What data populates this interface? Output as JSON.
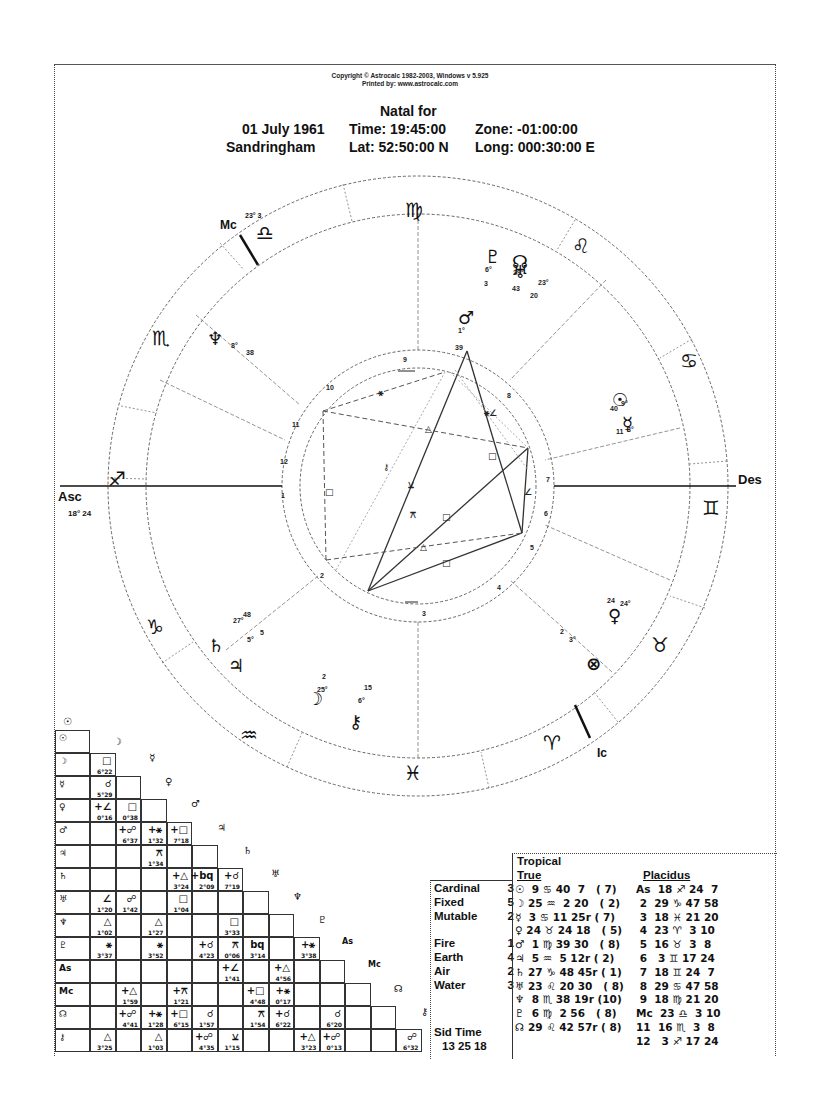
{
  "header": {
    "copyright": "Copyright © Astrocalc 1982-2003, Windows v 5.925",
    "printed_by": "Printed by: www.astrocalc.com",
    "title": "Natal for",
    "date": "01 July 1961",
    "time": "Time: 19:45:00",
    "zone": "Zone: -01:00:00",
    "place": "Sandringham",
    "lat": "Lat: 52:50:00 N",
    "long": "Long: 000:30:00 E"
  },
  "wheel": {
    "angles": {
      "asc_label": "Asc",
      "asc_degree": "18° 24",
      "des_label": "Des",
      "mc_label": "Mc",
      "mc_degree": "23° 3",
      "ic_label": "Ic"
    },
    "signs": [
      {
        "name": "virgo",
        "glyph": "♍"
      },
      {
        "name": "leo",
        "glyph": "♌"
      },
      {
        "name": "cancer",
        "glyph": "♋"
      },
      {
        "name": "gemini",
        "glyph": "♊"
      },
      {
        "name": "taurus",
        "glyph": "♉"
      },
      {
        "name": "aries",
        "glyph": "♈"
      },
      {
        "name": "pisces",
        "glyph": "♓"
      },
      {
        "name": "aquarius",
        "glyph": "♒"
      },
      {
        "name": "capricorn",
        "glyph": "♑"
      },
      {
        "name": "sagittarius",
        "glyph": "♐"
      },
      {
        "name": "scorpio",
        "glyph": "♏"
      },
      {
        "name": "libra",
        "glyph": "♎"
      }
    ],
    "planets": [
      {
        "name": "pluto",
        "glyph": "♇",
        "deg": "6°",
        "min": "3"
      },
      {
        "name": "north-node",
        "glyph": "☊",
        "deg": "29°",
        "min": "43"
      },
      {
        "name": "uranus",
        "glyph": "♅",
        "deg": "23°",
        "min": "20"
      },
      {
        "name": "mars",
        "glyph": "♂",
        "deg": "1°",
        "min": "39"
      },
      {
        "name": "neptune",
        "glyph": "♆",
        "deg": "8°",
        "min": "38"
      },
      {
        "name": "sun",
        "glyph": "☉",
        "deg": "9°",
        "min": "40"
      },
      {
        "name": "mercury",
        "glyph": "☿",
        "deg": "3°",
        "min": "11"
      },
      {
        "name": "venus",
        "glyph": "♀",
        "deg": "24°",
        "min": "24"
      },
      {
        "name": "part-of-fortune",
        "glyph": "⊗",
        "deg": "3°",
        "min": "2"
      },
      {
        "name": "saturn",
        "glyph": "♄",
        "deg": "27°",
        "min": "48"
      },
      {
        "name": "jupiter",
        "glyph": "♃",
        "deg": "5°",
        "min": "5"
      },
      {
        "name": "moon",
        "glyph": "☽",
        "deg": "25°",
        "min": "2"
      },
      {
        "name": "chiron",
        "glyph": "⚷",
        "deg": "6°",
        "min": "15"
      }
    ],
    "houses": [
      "1",
      "2",
      "3",
      "4",
      "5",
      "6",
      "7",
      "8",
      "9",
      "10",
      "11",
      "12"
    ]
  },
  "aspect_grid": {
    "headers": [
      "☉",
      "☽",
      "♅",
      "♀",
      "♂",
      "♃",
      "♄",
      "♅",
      "♆",
      "♇",
      "As",
      "Mc",
      "☊",
      "⚷"
    ],
    "rows": [
      {
        "label": "☉",
        "cells": []
      },
      {
        "label": "☽",
        "cells": [
          {
            "col": 0,
            "asp": "□",
            "orb": "6°22"
          }
        ]
      },
      {
        "label": "☿",
        "cells": [
          {
            "col": 0,
            "asp": "☌",
            "orb": "5°29"
          }
        ]
      },
      {
        "label": "♀",
        "cells": [
          {
            "col": 0,
            "asp": "+∠",
            "orb": "0°16"
          },
          {
            "col": 1,
            "asp": "□",
            "orb": "0°38"
          }
        ]
      },
      {
        "label": "♂",
        "cells": [
          {
            "col": 1,
            "asp": "+☍",
            "orb": "6°37"
          },
          {
            "col": 2,
            "asp": "+⚹",
            "orb": "1°32"
          },
          {
            "col": 3,
            "asp": "+□",
            "orb": "7°18"
          }
        ]
      },
      {
        "label": "♃",
        "cells": [
          {
            "col": 2,
            "asp": "⚻",
            "orb": "1°34"
          }
        ]
      },
      {
        "label": "♄",
        "cells": [
          {
            "col": 3,
            "asp": "+△",
            "orb": "3°24"
          },
          {
            "col": 4,
            "asp": "+bq",
            "orb": "2°09"
          },
          {
            "col": 5,
            "asp": "+☌",
            "orb": "7°19"
          }
        ]
      },
      {
        "label": "♅",
        "cells": [
          {
            "col": 0,
            "asp": "∠",
            "orb": "1°20"
          },
          {
            "col": 1,
            "asp": "☍",
            "orb": "1°42"
          },
          {
            "col": 3,
            "asp": "□",
            "orb": "1°04"
          }
        ]
      },
      {
        "label": "♆",
        "cells": [
          {
            "col": 0,
            "asp": "△",
            "orb": "1°02"
          },
          {
            "col": 2,
            "asp": "△",
            "orb": "1°27"
          },
          {
            "col": 5,
            "asp": "□",
            "orb": "3°33"
          }
        ]
      },
      {
        "label": "♇",
        "cells": [
          {
            "col": 0,
            "asp": "⚹",
            "orb": "3°37"
          },
          {
            "col": 2,
            "asp": "⚹",
            "orb": "3°52"
          },
          {
            "col": 4,
            "asp": "+☌",
            "orb": "4°23"
          },
          {
            "col": 5,
            "asp": "⚻",
            "orb": "0°06"
          },
          {
            "col": 6,
            "asp": "bq",
            "orb": "3°14"
          },
          {
            "col": 8,
            "asp": "+⚹",
            "orb": "3°38"
          }
        ]
      },
      {
        "label": "As",
        "cells": [
          {
            "col": 5,
            "asp": "+∠",
            "orb": "1°41"
          },
          {
            "col": 7,
            "asp": "+△",
            "orb": "4°56"
          }
        ]
      },
      {
        "label": "Mc",
        "cells": [
          {
            "col": 1,
            "asp": "+△",
            "orb": "1°59"
          },
          {
            "col": 3,
            "asp": "+⚻",
            "orb": "1°21"
          },
          {
            "col": 6,
            "asp": "+□",
            "orb": "4°48"
          },
          {
            "col": 7,
            "asp": "+⚹",
            "orb": "0°17"
          }
        ]
      },
      {
        "label": "☊",
        "cells": [
          {
            "col": 1,
            "asp": "+☍",
            "orb": "4°41"
          },
          {
            "col": 2,
            "asp": "+⚹",
            "orb": "1°28"
          },
          {
            "col": 3,
            "asp": "+□",
            "orb": "6°15"
          },
          {
            "col": 4,
            "asp": "☌",
            "orb": "1°57"
          },
          {
            "col": 6,
            "asp": "⚻",
            "orb": "1°54"
          },
          {
            "col": 7,
            "asp": "+☌",
            "orb": "6°22"
          },
          {
            "col": 9,
            "asp": "☌",
            "orb": "6°20"
          }
        ]
      },
      {
        "label": "⚷",
        "cells": [
          {
            "col": 0,
            "asp": "△",
            "orb": "3°25"
          },
          {
            "col": 2,
            "asp": "△",
            "orb": "1°03"
          },
          {
            "col": 4,
            "asp": "+☍",
            "orb": "4°35"
          },
          {
            "col": 5,
            "asp": "⚺",
            "orb": "1°15"
          },
          {
            "col": 8,
            "asp": "+△",
            "orb": "3°23"
          },
          {
            "col": 9,
            "asp": "+☍",
            "orb": "0°13"
          },
          {
            "col": 12,
            "asp": "☍",
            "orb": "6°32"
          }
        ]
      }
    ]
  },
  "elements": {
    "rows": [
      {
        "label": "Cardinal",
        "value": "3"
      },
      {
        "label": "Fixed",
        "value": "5"
      },
      {
        "label": "Mutable",
        "value": "2"
      },
      {
        "label": "",
        "value": ""
      },
      {
        "label": "Fire",
        "value": "1"
      },
      {
        "label": "Earth",
        "value": "4"
      },
      {
        "label": "Air",
        "value": "2"
      },
      {
        "label": "Water",
        "value": "3"
      }
    ],
    "sid_time_label": "Sid Time",
    "sid_time_value": "13 25 18"
  },
  "positions": {
    "zodiac": "Tropical",
    "node": "True",
    "house_system": "Placidus",
    "planets": [
      "☉  9 ♋ 40  7   ( 7)",
      "☽ 25 ♒  2 20   ( 2)",
      "☿  3 ♋ 11 25r ( 7)",
      "♀ 24 ♉ 24 18   ( 5)",
      "♂  1 ♍ 39 30   ( 8)",
      "♃  5 ♒  5 12r ( 2)",
      "♄ 27 ♑ 48 45r ( 1)",
      "♅ 23 ♌ 20 30   ( 8)",
      "♆  8 ♏ 38 19r (10)",
      "♇  6 ♍  2 56   ( 8)",
      "☊ 29 ♌ 42 57r ( 8)"
    ],
    "houses": [
      "As  18 ♐ 24  7",
      " 2  29 ♑ 47 58",
      " 3  18 ♓ 21 20",
      " 4  23 ♈  3 10",
      " 5  16 ♉  3  8",
      " 6   3 ♊ 17 24",
      " 7  18 ♊ 24  7",
      " 8  29 ♋ 47 58",
      " 9  18 ♍ 21 20",
      "Mc  23 ♎  3 10",
      "11  16 ♏  3  8",
      "12   3 ♐ 17 24"
    ]
  },
  "chart_data": {
    "type": "table",
    "subtitle": "Time: 19:45:00 Zone: -01:00:00 Lat: 52:50:00 N Long: 000:30:00 E",
    "zodiac": "Tropical",
    "house_system": "Placidus",
    "planets": [
      {
        "body": "Sun",
        "sign": "Cancer",
        "deg": 9,
        "min": 40,
        "sec": 7,
        "retro": false,
        "house": 7
      },
      {
        "body": "Moon",
        "sign": "Aquarius",
        "deg": 25,
        "min": 2,
        "sec": 20,
        "retro": false,
        "house": 2
      },
      {
        "body": "Mercury",
        "sign": "Cancer",
        "deg": 3,
        "min": 11,
        "sec": 25,
        "retro": true,
        "house": 7
      },
      {
        "body": "Venus",
        "sign": "Taurus",
        "deg": 24,
        "min": 24,
        "sec": 18,
        "retro": false,
        "house": 5
      },
      {
        "body": "Mars",
        "sign": "Virgo",
        "deg": 1,
        "min": 39,
        "sec": 30,
        "retro": false,
        "house": 8
      },
      {
        "body": "Jupiter",
        "sign": "Aquarius",
        "deg": 5,
        "min": 5,
        "sec": 12,
        "retro": true,
        "house": 2
      },
      {
        "body": "Saturn",
        "sign": "Capricorn",
        "deg": 27,
        "min": 48,
        "sec": 45,
        "retro": true,
        "house": 1
      },
      {
        "body": "Uranus",
        "sign": "Leo",
        "deg": 23,
        "min": 20,
        "sec": 30,
        "retro": false,
        "house": 8
      },
      {
        "body": "Neptune",
        "sign": "Scorpio",
        "deg": 8,
        "min": 38,
        "sec": 19,
        "retro": true,
        "house": 10
      },
      {
        "body": "Pluto",
        "sign": "Virgo",
        "deg": 6,
        "min": 2,
        "sec": 56,
        "retro": false,
        "house": 8
      },
      {
        "body": "North Node",
        "sign": "Leo",
        "deg": 29,
        "min": 42,
        "sec": 57,
        "retro": true,
        "house": 8
      }
    ],
    "houses": [
      {
        "house": "As",
        "sign": "Sagittarius",
        "deg": 18,
        "min": 24,
        "sec": 7
      },
      {
        "house": "2",
        "sign": "Capricorn",
        "deg": 29,
        "min": 47,
        "sec": 58
      },
      {
        "house": "3",
        "sign": "Pisces",
        "deg": 18,
        "min": 21,
        "sec": 20
      },
      {
        "house": "4",
        "sign": "Aries",
        "deg": 23,
        "min": 3,
        "sec": 10
      },
      {
        "house": "5",
        "sign": "Taurus",
        "deg": 16,
        "min": 3,
        "sec": 8
      },
      {
        "house": "6",
        "sign": "Gemini",
        "deg": 3,
        "min": 17,
        "sec": 24
      },
      {
        "house": "7",
        "sign": "Gemini",
        "deg": 18,
        "min": 24,
        "sec": 7
      },
      {
        "house": "8",
        "sign": "Cancer",
        "deg": 29,
        "min": 47,
        "sec": 58
      },
      {
        "house": "9",
        "sign": "Virgo",
        "deg": 18,
        "min": 21,
        "sec": 20
      },
      {
        "house": "Mc",
        "sign": "Libra",
        "deg": 23,
        "min": 3,
        "sec": 10
      },
      {
        "house": "11",
        "sign": "Scorpio",
        "deg": 16,
        "min": 3,
        "sec": 8
      },
      {
        "house": "12",
        "sign": "Sagittarius",
        "deg": 3,
        "min": 17,
        "sec": 24
      }
    ],
    "modalities": {
      "Cardinal": 3,
      "Fixed": 5,
      "Mutable": 2
    },
    "elements": {
      "Fire": 1,
      "Earth": 4,
      "Air": 2,
      "Water": 3
    },
    "sidereal_time": "13 25 18"
  }
}
